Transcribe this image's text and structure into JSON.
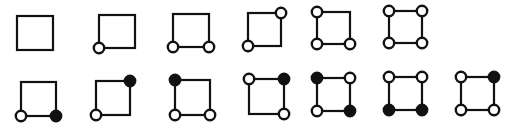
{
  "figure": {
    "description": "Two rows of squares with circles marked at corners (open = white circle, filled = black circle)",
    "node_radius": 5.2,
    "colors": {
      "stroke": "#111111",
      "open_fill": "#ffffff",
      "filled_fill": "#111111",
      "background": "#ffffff"
    },
    "rows": [
      {
        "name": "row-1",
        "squares": [
          {
            "x1": 17,
            "y1": 16,
            "x2": 53,
            "y2": 50,
            "nodes": {
              "tl": "none",
              "tr": "none",
              "bl": "none",
              "br": "none"
            }
          },
          {
            "x1": 99,
            "y1": 15,
            "x2": 135,
            "y2": 48,
            "nodes": {
              "tl": "none",
              "tr": "none",
              "bl": "open",
              "br": "none"
            }
          },
          {
            "x1": 173,
            "y1": 14,
            "x2": 209,
            "y2": 47,
            "nodes": {
              "tl": "none",
              "tr": "none",
              "bl": "open",
              "br": "open"
            }
          },
          {
            "x1": 248,
            "y1": 13,
            "x2": 281,
            "y2": 46,
            "nodes": {
              "tl": "none",
              "tr": "open",
              "bl": "open",
              "br": "none"
            }
          },
          {
            "x1": 317,
            "y1": 12,
            "x2": 350,
            "y2": 44,
            "nodes": {
              "tl": "open",
              "tr": "none",
              "bl": "open",
              "br": "open"
            }
          },
          {
            "x1": 389,
            "y1": 11,
            "x2": 422,
            "y2": 43,
            "nodes": {
              "tl": "open",
              "tr": "open",
              "bl": "open",
              "br": "open"
            }
          }
        ]
      },
      {
        "name": "row-2",
        "squares": [
          {
            "x1": 21,
            "y1": 82,
            "x2": 56,
            "y2": 116,
            "nodes": {
              "tl": "none",
              "tr": "none",
              "bl": "open",
              "br": "filled"
            }
          },
          {
            "x1": 96,
            "y1": 81,
            "x2": 130,
            "y2": 115,
            "nodes": {
              "tl": "none",
              "tr": "filled",
              "bl": "open",
              "br": "none"
            }
          },
          {
            "x1": 175,
            "y1": 80,
            "x2": 210,
            "y2": 115,
            "nodes": {
              "tl": "filled",
              "tr": "none",
              "bl": "open",
              "br": "open"
            }
          },
          {
            "x1": 249,
            "y1": 79,
            "x2": 284,
            "y2": 114,
            "nodes": {
              "tl": "open",
              "tr": "filled",
              "bl": "none",
              "br": "open"
            }
          },
          {
            "x1": 317,
            "y1": 78,
            "x2": 350,
            "y2": 111,
            "nodes": {
              "tl": "filled",
              "tr": "open",
              "bl": "open",
              "br": "filled"
            }
          },
          {
            "x1": 389,
            "y1": 77,
            "x2": 422,
            "y2": 110,
            "nodes": {
              "tl": "open",
              "tr": "open",
              "bl": "filled",
              "br": "filled"
            }
          },
          {
            "x1": 461,
            "y1": 77,
            "x2": 494,
            "y2": 110,
            "nodes": {
              "tl": "open",
              "tr": "filled",
              "bl": "open",
              "br": "open"
            }
          }
        ]
      }
    ]
  }
}
